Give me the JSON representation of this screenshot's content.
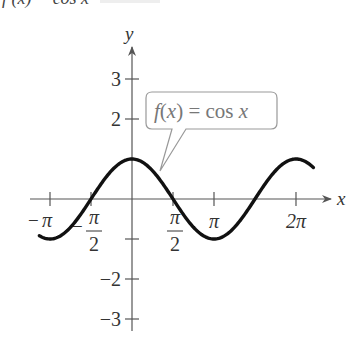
{
  "header_fragment": "f (x) = cos x",
  "chart_data": {
    "type": "line",
    "title": "",
    "function": "cos x",
    "xlabel": "x",
    "ylabel": "y",
    "x_ticks": [
      {
        "value": -3.14159,
        "label": "−π"
      },
      {
        "value": -1.5708,
        "label": "−π/2"
      },
      {
        "value": 1.5708,
        "label": "π/2"
      },
      {
        "value": 3.14159,
        "label": "π"
      },
      {
        "value": 6.28319,
        "label": "2π"
      }
    ],
    "y_ticks": [
      {
        "value": 3,
        "label": "3"
      },
      {
        "value": 2,
        "label": "2"
      },
      {
        "value": -1,
        "label": ""
      },
      {
        "value": -2,
        "label": "−2"
      },
      {
        "value": -3,
        "label": "−3"
      }
    ],
    "xlim": [
      -3.5,
      6.9
    ],
    "ylim": [
      -3.5,
      3.7
    ],
    "curve_domain": [
      -3.55,
      6.95
    ],
    "series": [
      {
        "name": "f(x) = cos x",
        "expr": "cos",
        "color": "#111111"
      }
    ],
    "annotation": {
      "text_parts": [
        "f",
        "(",
        "x",
        ") = cos ",
        "x"
      ],
      "full": "f(x) = cos x"
    },
    "grid": false,
    "legend": "callout"
  },
  "axis": {
    "origin_px": [
      132,
      199
    ],
    "x_unit_px": 26.1,
    "y_unit_px": 40
  },
  "colors": {
    "curve": "#111111",
    "axis": "#555555",
    "callout_border": "#999999",
    "callout_text": "#777777"
  }
}
